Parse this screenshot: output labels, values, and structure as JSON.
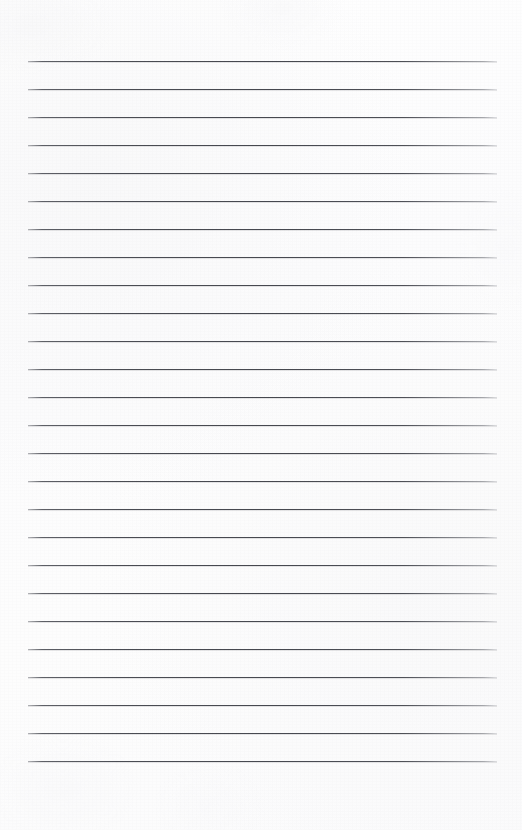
{
  "document": {
    "type": "ruled-notebook-page",
    "title": "Blank Lined Paper",
    "description": "Scanned blank ruled notebook page with no handwriting or printed text",
    "page_width": 522,
    "page_height": 830,
    "background_color": "#fdfdfd",
    "has_text_content": false,
    "has_margin_rule": false,
    "has_header": false,
    "has_page_number": false
  },
  "ruling": {
    "line_color": "#4a4c53",
    "line_thickness_px": 1,
    "line_count": 26,
    "line_left_px": 28,
    "line_right_px": 497,
    "line_width_px": 469,
    "first_line_y_px": 61,
    "line_spacing_px": 28,
    "last_line_y_px": 761,
    "top_margin_px": 61,
    "bottom_margin_px": 69,
    "left_margin_px": 28,
    "right_margin_px": 25,
    "lines_y": [
      61,
      89,
      117,
      145,
      173,
      201,
      229,
      257,
      285,
      313,
      313,
      341,
      369,
      397,
      425,
      453,
      481,
      509,
      537,
      565,
      593,
      621,
      649,
      677,
      705,
      733,
      761
    ]
  },
  "content": {
    "lines": [
      {
        "index": 1,
        "y": 61,
        "text": ""
      },
      {
        "index": 2,
        "y": 89,
        "text": ""
      },
      {
        "index": 3,
        "y": 117,
        "text": ""
      },
      {
        "index": 4,
        "y": 145,
        "text": ""
      },
      {
        "index": 5,
        "y": 173,
        "text": ""
      },
      {
        "index": 6,
        "y": 201,
        "text": ""
      },
      {
        "index": 7,
        "y": 229,
        "text": ""
      },
      {
        "index": 8,
        "y": 257,
        "text": ""
      },
      {
        "index": 9,
        "y": 285,
        "text": ""
      },
      {
        "index": 10,
        "y": 313,
        "text": ""
      },
      {
        "index": 11,
        "y": 341,
        "text": ""
      },
      {
        "index": 12,
        "y": 369,
        "text": ""
      },
      {
        "index": 13,
        "y": 397,
        "text": ""
      },
      {
        "index": 14,
        "y": 425,
        "text": ""
      },
      {
        "index": 15,
        "y": 453,
        "text": ""
      },
      {
        "index": 16,
        "y": 481,
        "text": ""
      },
      {
        "index": 17,
        "y": 509,
        "text": ""
      },
      {
        "index": 18,
        "y": 537,
        "text": ""
      },
      {
        "index": 19,
        "y": 565,
        "text": ""
      },
      {
        "index": 20,
        "y": 593,
        "text": ""
      },
      {
        "index": 21,
        "y": 621,
        "text": ""
      },
      {
        "index": 22,
        "y": 649,
        "text": ""
      },
      {
        "index": 23,
        "y": 677,
        "text": ""
      },
      {
        "index": 24,
        "y": 705,
        "text": ""
      },
      {
        "index": 25,
        "y": 733,
        "text": ""
      },
      {
        "index": 26,
        "y": 761,
        "text": ""
      }
    ]
  }
}
